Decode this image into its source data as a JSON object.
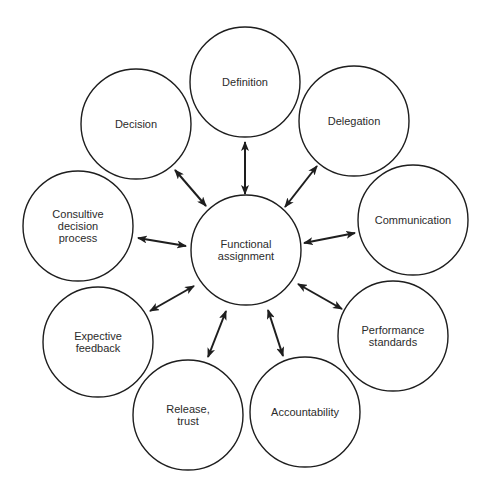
{
  "diagram": {
    "type": "hub-and-spoke",
    "stroke_color": "#1e1e1e",
    "text_color": "#2b2b2b",
    "hub": {
      "id": "functional-assignment",
      "label": "Functional\nassignment",
      "cx": 246,
      "cy": 250,
      "r": 55
    },
    "nodes": [
      {
        "id": "definition",
        "label": "Definition",
        "cx": 245,
        "cy": 82,
        "r": 55,
        "arrow": {
          "x1": 245,
          "y1": 142,
          "x2": 245,
          "y2": 194
        }
      },
      {
        "id": "delegation",
        "label": "Delegation",
        "cx": 354,
        "cy": 121,
        "r": 55,
        "arrow": {
          "x1": 317,
          "y1": 166,
          "x2": 285,
          "y2": 207
        }
      },
      {
        "id": "communication",
        "label": "Communication",
        "cx": 413,
        "cy": 220,
        "r": 55,
        "arrow": {
          "x1": 355,
          "y1": 233,
          "x2": 304,
          "y2": 243
        }
      },
      {
        "id": "performance-standards",
        "label": "Performance\nstandards",
        "cx": 393,
        "cy": 336,
        "r": 55,
        "arrow": {
          "x1": 342,
          "y1": 309,
          "x2": 298,
          "y2": 284
        }
      },
      {
        "id": "accountability",
        "label": "Accountability",
        "cx": 305,
        "cy": 412,
        "r": 55,
        "arrow": {
          "x1": 283,
          "y1": 356,
          "x2": 268,
          "y2": 310
        }
      },
      {
        "id": "release-trust",
        "label": "Release,\ntrust",
        "cx": 188,
        "cy": 415,
        "r": 55,
        "arrow": {
          "x1": 208,
          "y1": 357,
          "x2": 226,
          "y2": 311
        }
      },
      {
        "id": "expective-feedback",
        "label": "Expective\nfeedback",
        "cx": 98,
        "cy": 342,
        "r": 55,
        "arrow": {
          "x1": 150,
          "y1": 311,
          "x2": 194,
          "y2": 286
        }
      },
      {
        "id": "consultive-decision-process",
        "label": "Consultive\ndecision\nprocess",
        "cx": 78,
        "cy": 226,
        "r": 55,
        "arrow": {
          "x1": 138,
          "y1": 238,
          "x2": 186,
          "y2": 246
        }
      },
      {
        "id": "decision",
        "label": "Decision",
        "cx": 136,
        "cy": 124,
        "r": 55,
        "arrow": {
          "x1": 175,
          "y1": 170,
          "x2": 206,
          "y2": 206
        }
      }
    ],
    "edges": [
      {
        "from": "functional-assignment",
        "to": "definition",
        "direction": "bidirectional"
      },
      {
        "from": "functional-assignment",
        "to": "delegation",
        "direction": "bidirectional"
      },
      {
        "from": "functional-assignment",
        "to": "communication",
        "direction": "bidirectional"
      },
      {
        "from": "functional-assignment",
        "to": "performance-standards",
        "direction": "bidirectional"
      },
      {
        "from": "functional-assignment",
        "to": "accountability",
        "direction": "bidirectional"
      },
      {
        "from": "functional-assignment",
        "to": "release-trust",
        "direction": "bidirectional"
      },
      {
        "from": "functional-assignment",
        "to": "expective-feedback",
        "direction": "bidirectional"
      },
      {
        "from": "functional-assignment",
        "to": "consultive-decision-process",
        "direction": "bidirectional"
      },
      {
        "from": "functional-assignment",
        "to": "decision",
        "direction": "bidirectional"
      }
    ]
  }
}
